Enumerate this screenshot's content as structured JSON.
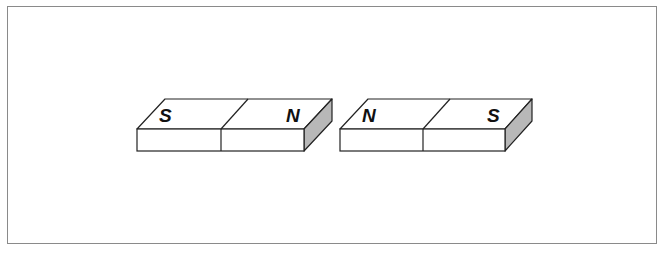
{
  "diagram": {
    "colors": {
      "frame": "#8a8a8a",
      "outline": "#222222",
      "face": "#ffffff",
      "side_shade": "#b8b8b8"
    },
    "magnets": [
      {
        "id": "magnet-left",
        "left_pole": "S",
        "right_pole": "N"
      },
      {
        "id": "magnet-right",
        "left_pole": "N",
        "right_pole": "S"
      }
    ]
  }
}
